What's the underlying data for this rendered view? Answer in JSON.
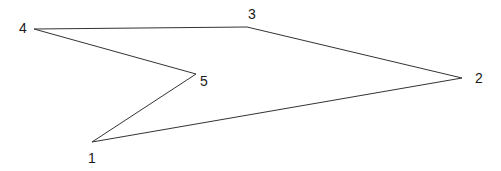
{
  "diagram": {
    "type": "polygon",
    "stroke_color": "#333333",
    "vertices": [
      {
        "id": "1",
        "label": "1",
        "x": 92,
        "y": 142,
        "lx": 88,
        "ly": 163
      },
      {
        "id": "2",
        "label": "2",
        "x": 462,
        "y": 78,
        "lx": 475,
        "ly": 83
      },
      {
        "id": "3",
        "label": "3",
        "x": 247,
        "y": 27,
        "lx": 248,
        "ly": 19
      },
      {
        "id": "4",
        "label": "4",
        "x": 34,
        "y": 29,
        "lx": 19,
        "ly": 33
      },
      {
        "id": "5",
        "label": "5",
        "x": 196,
        "y": 74,
        "lx": 200,
        "ly": 86
      }
    ],
    "edges": [
      [
        "4",
        "3"
      ],
      [
        "3",
        "2"
      ],
      [
        "2",
        "1"
      ],
      [
        "1",
        "5"
      ],
      [
        "5",
        "4"
      ]
    ]
  }
}
